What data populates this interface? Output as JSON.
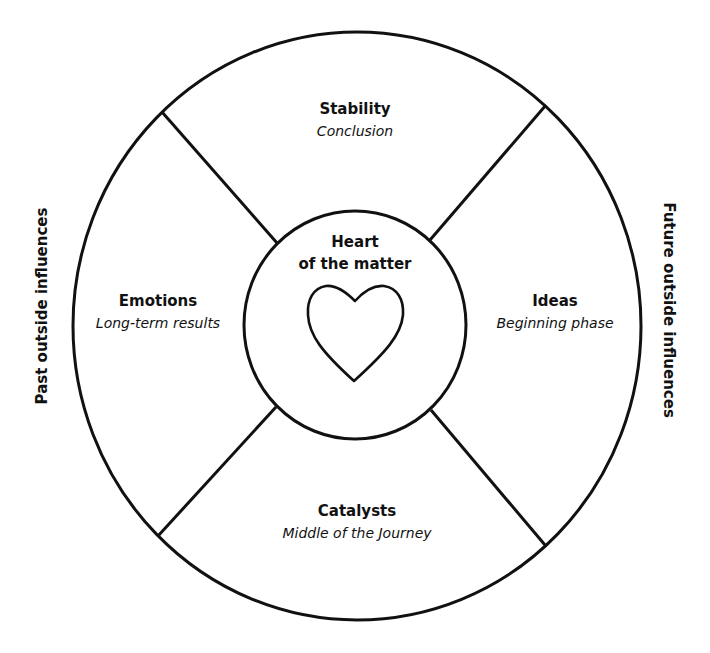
{
  "diagram": {
    "type": "circular-spread",
    "center": {
      "title_line1": "Heart",
      "title_line2": "of the matter",
      "icon": "heart-icon"
    },
    "sections": {
      "top": {
        "title": "Stability",
        "subtitle": "Conclusion"
      },
      "left": {
        "title": "Emotions",
        "subtitle": "Long-term results"
      },
      "right": {
        "title": "Ideas",
        "subtitle": "Beginning phase"
      },
      "bottom": {
        "title": "Catalysts",
        "subtitle": "Middle of the Journey"
      }
    },
    "side_labels": {
      "left": "Past outside influences",
      "right": "Future outside influences"
    },
    "colors": {
      "stroke": "#111111",
      "background": "#ffffff"
    }
  }
}
